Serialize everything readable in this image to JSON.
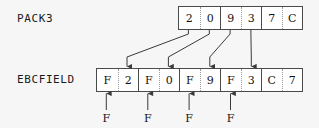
{
  "diagram": {
    "title_row_labels": {
      "source_label": "PACK3",
      "target_label": "EBCFIELD"
    },
    "colors": {
      "background": "#f6f6f6",
      "cell_fill": "#ffffff",
      "border": "#4a4a4a",
      "inner_divider": "#9a9a9a",
      "text": "#121212",
      "connector": "#3a3a3a"
    },
    "source_field": {
      "name": "PACK3",
      "nibbles": [
        {
          "value": "2",
          "byte_start": true
        },
        {
          "value": "0",
          "byte_start": false
        },
        {
          "value": "9",
          "byte_start": true
        },
        {
          "value": "3",
          "byte_start": false
        },
        {
          "value": "7",
          "byte_start": true
        },
        {
          "value": "C",
          "byte_start": false
        }
      ]
    },
    "target_field": {
      "name": "EBCFIELD",
      "nibbles": [
        {
          "value": "F",
          "byte_start": true
        },
        {
          "value": "2",
          "byte_start": false
        },
        {
          "value": "F",
          "byte_start": true
        },
        {
          "value": "0",
          "byte_start": false
        },
        {
          "value": "F",
          "byte_start": true
        },
        {
          "value": "9",
          "byte_start": false
        },
        {
          "value": "F",
          "byte_start": true
        },
        {
          "value": "3",
          "byte_start": false
        },
        {
          "value": "C",
          "byte_start": true
        },
        {
          "value": "7",
          "byte_start": false
        }
      ]
    },
    "mappings": [
      {
        "from_nibble": "2",
        "to_nibble": "2",
        "from_index": 0,
        "to_index": 1
      },
      {
        "from_nibble": "0",
        "to_nibble": "0",
        "from_index": 1,
        "to_index": 3
      },
      {
        "from_nibble": "9",
        "to_nibble": "9",
        "from_index": 2,
        "to_index": 5
      },
      {
        "from_nibble": "3",
        "to_nibble": "3",
        "from_index": 3,
        "to_index": 7
      }
    ],
    "fill_annotations": [
      {
        "label": "F",
        "target_index": 0
      },
      {
        "label": "F",
        "target_index": 2
      },
      {
        "label": "F",
        "target_index": 4
      },
      {
        "label": "F",
        "target_index": 6
      }
    ]
  }
}
